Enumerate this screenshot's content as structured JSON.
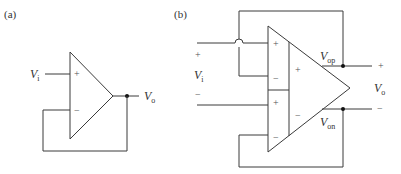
{
  "figure": {
    "panel_a": {
      "label": "(a)",
      "input_label": {
        "symbol": "V",
        "subscript": "i"
      },
      "output_label": {
        "symbol": "V",
        "subscript": "o"
      },
      "plus_sign": "+",
      "minus_sign": "−"
    },
    "panel_b": {
      "label": "(b)",
      "input_label": {
        "symbol": "V",
        "subscript": "i"
      },
      "input_plus": "+",
      "input_minus": "−",
      "upper_stage_plus": "+",
      "upper_stage_minus": "−",
      "lower_stage_plus": "+",
      "lower_stage_minus": "−",
      "inner_plus": "+",
      "inner_minus": "−",
      "output_positive_label": {
        "symbol": "V",
        "subscript": "op"
      },
      "output_negative_label": {
        "symbol": "V",
        "subscript": "on"
      },
      "output_label": {
        "symbol": "V",
        "subscript": "o"
      },
      "output_plus": "+",
      "output_minus": "−"
    },
    "colors": {
      "wire": "#3a3a3a",
      "text": "#333333",
      "node": "#111111",
      "background": "#ffffff"
    }
  }
}
